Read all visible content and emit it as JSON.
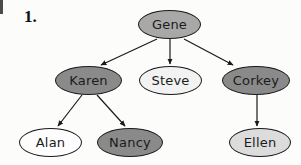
{
  "figure": {
    "item_number": "1.",
    "background_color": "#fcfcfb",
    "outline_color": "#1a1a1a",
    "edge_color": "#1a1a1a"
  },
  "palette": {
    "white": "#fdfdfd",
    "light_gray": "#dcdcdc",
    "medium_gray": "#a8a8a8",
    "dark_gray": "#8a8a8a"
  },
  "nodes": [
    {
      "id": "gene",
      "label": "Gene",
      "fill": "#a8a8a8",
      "x": 138,
      "y": 10,
      "w": 63,
      "h": 29,
      "tier": 1
    },
    {
      "id": "karen",
      "label": "Karen",
      "fill": "#8a8a8a",
      "x": 55,
      "y": 66,
      "w": 67,
      "h": 29,
      "tier": 2
    },
    {
      "id": "steve",
      "label": "Steve",
      "fill": "#f2f2f2",
      "x": 139,
      "y": 66,
      "w": 63,
      "h": 29,
      "tier": 2
    },
    {
      "id": "corkey",
      "label": "Corkey",
      "fill": "#8a8a8a",
      "x": 222,
      "y": 66,
      "w": 68,
      "h": 29,
      "tier": 2
    },
    {
      "id": "alan",
      "label": "Alan",
      "fill": "#fdfdfd",
      "x": 19,
      "y": 128,
      "w": 63,
      "h": 29,
      "tier": 3
    },
    {
      "id": "nancy",
      "label": "Nancy",
      "fill": "#8a8a8a",
      "x": 97,
      "y": 128,
      "w": 66,
      "h": 29,
      "tier": 3
    },
    {
      "id": "ellen",
      "label": "Ellen",
      "fill": "#dcdcdc",
      "x": 229,
      "y": 128,
      "w": 62,
      "h": 29,
      "tier": 3
    }
  ],
  "edges": [
    {
      "id": "gene-karen",
      "from": "gene",
      "to": "karen",
      "x1": 157,
      "y1": 39,
      "x2": 101,
      "y2": 65,
      "arrow": true
    },
    {
      "id": "gene-steve",
      "from": "gene",
      "to": "steve",
      "x1": 170,
      "y1": 39,
      "x2": 170,
      "y2": 64,
      "arrow": true
    },
    {
      "id": "gene-corkey",
      "from": "gene",
      "to": "corkey",
      "x1": 184,
      "y1": 39,
      "x2": 233,
      "y2": 65,
      "arrow": true
    },
    {
      "id": "karen-alan",
      "from": "karen",
      "to": "alan",
      "x1": 82,
      "y1": 95,
      "x2": 58,
      "y2": 126,
      "arrow": true
    },
    {
      "id": "karen-nancy",
      "from": "karen",
      "to": "nancy",
      "x1": 97,
      "y1": 95,
      "x2": 125,
      "y2": 126,
      "arrow": true
    },
    {
      "id": "corkey-ellen",
      "from": "corkey",
      "to": "ellen",
      "x1": 257,
      "y1": 95,
      "x2": 257,
      "y2": 126,
      "arrow": true
    }
  ]
}
